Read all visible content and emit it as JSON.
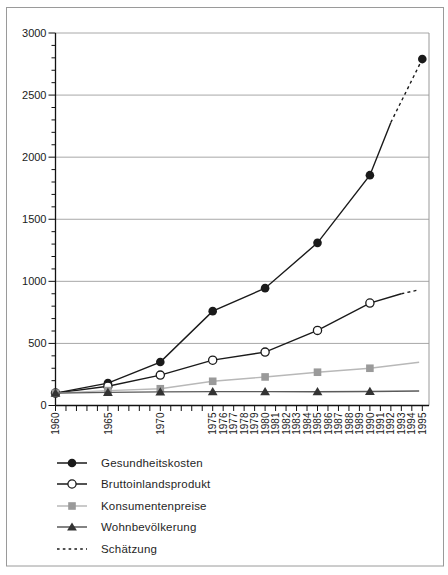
{
  "figure": {
    "background": "#ffffff",
    "border_color": "#9a9a9a"
  },
  "chart_data": {
    "type": "line",
    "title": "",
    "xlabel": "",
    "ylabel": "",
    "index_note": "indexed series, 1960 = 100",
    "ylim": [
      0,
      3000
    ],
    "y_major_ticks": [
      0,
      500,
      1000,
      1500,
      2000,
      2500,
      3000
    ],
    "y_minor_step": 100,
    "xlim": [
      1960,
      1995
    ],
    "x_tick_step": 1,
    "x_labeled_years": [
      1960,
      1965,
      1970,
      1975,
      1976,
      1977,
      1978,
      1979,
      1980,
      1981,
      1982,
      1983,
      1984,
      1985,
      1986,
      1987,
      1988,
      1989,
      1990,
      1991,
      1992,
      1993,
      1994,
      1995
    ],
    "grid": "horizontal-major-on",
    "grid_color": "#a8a8a8",
    "axis_color": "#111111",
    "legend_position": "bottom-left",
    "series": [
      {
        "key": "gesundheitskosten",
        "name": "Gesundheitskosten",
        "marker": "circle-filled",
        "color": "#1a1a1a",
        "line_color": "#1a1a1a",
        "marker_points": [
          [
            1960,
            100
          ],
          [
            1965,
            180
          ],
          [
            1970,
            350
          ],
          [
            1975,
            760
          ],
          [
            1980,
            945
          ],
          [
            1985,
            1310
          ],
          [
            1990,
            1855
          ],
          [
            1995,
            2790
          ]
        ],
        "segments": [
          {
            "style": "solid",
            "points": [
              [
                1960,
                100
              ],
              [
                1965,
                180
              ],
              [
                1970,
                350
              ],
              [
                1975,
                760
              ],
              [
                1980,
                945
              ],
              [
                1985,
                1310
              ],
              [
                1990,
                1855
              ],
              [
                1992,
                2280
              ]
            ]
          },
          {
            "style": "dashed",
            "points": [
              [
                1992,
                2280
              ],
              [
                1995,
                2790
              ]
            ]
          }
        ]
      },
      {
        "key": "bruttoinlandsprodukt",
        "name": "Bruttoinlandsprodukt",
        "marker": "circle-open",
        "color": "#1a1a1a",
        "line_color": "#1a1a1a",
        "marker_points": [
          [
            1960,
            100
          ],
          [
            1965,
            155
          ],
          [
            1970,
            245
          ],
          [
            1975,
            365
          ],
          [
            1980,
            430
          ],
          [
            1985,
            605
          ],
          [
            1990,
            825
          ]
        ],
        "segments": [
          {
            "style": "solid",
            "points": [
              [
                1960,
                100
              ],
              [
                1965,
                155
              ],
              [
                1970,
                245
              ],
              [
                1975,
                365
              ],
              [
                1980,
                430
              ],
              [
                1985,
                605
              ],
              [
                1990,
                825
              ],
              [
                1993,
                900
              ]
            ]
          },
          {
            "style": "dashed",
            "points": [
              [
                1993,
                900
              ],
              [
                1994.6,
                930
              ]
            ]
          }
        ]
      },
      {
        "key": "konsumentenpreise",
        "name": "Konsumentenpreise",
        "marker": "square",
        "color": "#9a9a9a",
        "line_color": "#b8b8b8",
        "marker_points": [
          [
            1960,
            100
          ],
          [
            1965,
            120
          ],
          [
            1970,
            135
          ],
          [
            1975,
            195
          ],
          [
            1980,
            230
          ],
          [
            1985,
            268
          ],
          [
            1990,
            300
          ]
        ],
        "segments": [
          {
            "style": "solid",
            "points": [
              [
                1960,
                100
              ],
              [
                1965,
                120
              ],
              [
                1970,
                135
              ],
              [
                1975,
                195
              ],
              [
                1980,
                230
              ],
              [
                1985,
                268
              ],
              [
                1990,
                300
              ],
              [
                1994.7,
                348
              ]
            ]
          }
        ]
      },
      {
        "key": "wohnbevoelkerung",
        "name": "Wohnbevölkerung",
        "marker": "triangle",
        "color": "#333333",
        "line_color": "#5a5a5a",
        "marker_points": [
          [
            1960,
            100
          ],
          [
            1965,
            106
          ],
          [
            1970,
            110
          ],
          [
            1975,
            112
          ],
          [
            1980,
            112
          ],
          [
            1985,
            111
          ],
          [
            1990,
            113
          ]
        ],
        "segments": [
          {
            "style": "solid",
            "points": [
              [
                1960,
                100
              ],
              [
                1965,
                106
              ],
              [
                1970,
                110
              ],
              [
                1975,
                112
              ],
              [
                1980,
                112
              ],
              [
                1985,
                111
              ],
              [
                1990,
                113
              ],
              [
                1994.7,
                117
              ]
            ]
          }
        ]
      }
    ],
    "legend": [
      {
        "label": "Gesundheitskosten",
        "series_key": "gesundheitskosten"
      },
      {
        "label": "Bruttoinlandsprodukt",
        "series_key": "bruttoinlandsprodukt"
      },
      {
        "label": "Konsumentenpreise",
        "series_key": "konsumentenpreise"
      },
      {
        "label": "Wohnbevölkerung",
        "series_key": "wohnbevoelkerung"
      },
      {
        "label": "Schätzung",
        "style": "dashed",
        "color": "#1a1a1a"
      }
    ]
  }
}
